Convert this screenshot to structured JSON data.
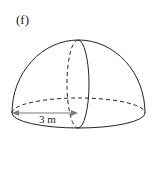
{
  "figure": {
    "part_label": "(f)",
    "shape": "hemisphere",
    "radius_label": "3 m",
    "colors": {
      "outline": "#222222",
      "arrow": "#7a7a7a",
      "background": "#ffffff"
    }
  }
}
